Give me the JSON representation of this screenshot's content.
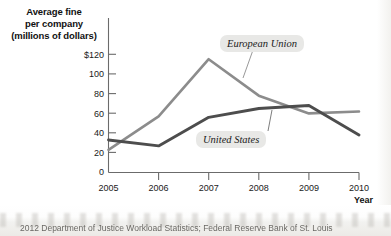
{
  "chart_data": {
    "type": "line",
    "title": "",
    "ylabel": "Average fine per company (millions of dollars)",
    "xlabel": "Year",
    "x": [
      2005,
      2006,
      2007,
      2008,
      2009,
      2010
    ],
    "categories": [
      "2005",
      "2006",
      "2007",
      "2008",
      "2009",
      "2010"
    ],
    "xlim": [
      2005,
      2010
    ],
    "ylim": [
      0,
      120
    ],
    "yticks": [
      0,
      20,
      40,
      60,
      80,
      100,
      120
    ],
    "ytick_labels": [
      "0",
      "20",
      "40",
      "60",
      "80",
      "100",
      "$120"
    ],
    "xtick_labels": [
      "2005",
      "2006",
      "2007",
      "2008",
      "2009",
      "2010"
    ],
    "grid": false,
    "legend": "inline-annotations",
    "series": [
      {
        "name": "European Union",
        "color": "#8c8c8c",
        "values": [
          23,
          57,
          115,
          78,
          60,
          62
        ]
      },
      {
        "name": "United States",
        "color": "#4d4d4d",
        "values": [
          33,
          27,
          56,
          65,
          68,
          38
        ]
      }
    ],
    "annotations": [
      {
        "text": "European Union",
        "series": "European Union",
        "x": 2007.6,
        "y": 92
      },
      {
        "text": "United States",
        "series": "United States",
        "x": 2007.9,
        "y": 45
      }
    ]
  },
  "axis": {
    "y_title_line1": "Average fine",
    "y_title_line2": "per company",
    "y_title_line3": "(millions of dollars)",
    "x_axis_title": "Year"
  },
  "footer": {
    "caption": "2012 Department of Justice Workload Statistics; Federal Reserve Bank of St. Louis"
  },
  "colors": {
    "series_eu": "#8c8c8c",
    "series_us": "#4d4d4d",
    "axis": "#6b6b6b",
    "text": "#111111",
    "label_pill": "#e8e8e6"
  }
}
